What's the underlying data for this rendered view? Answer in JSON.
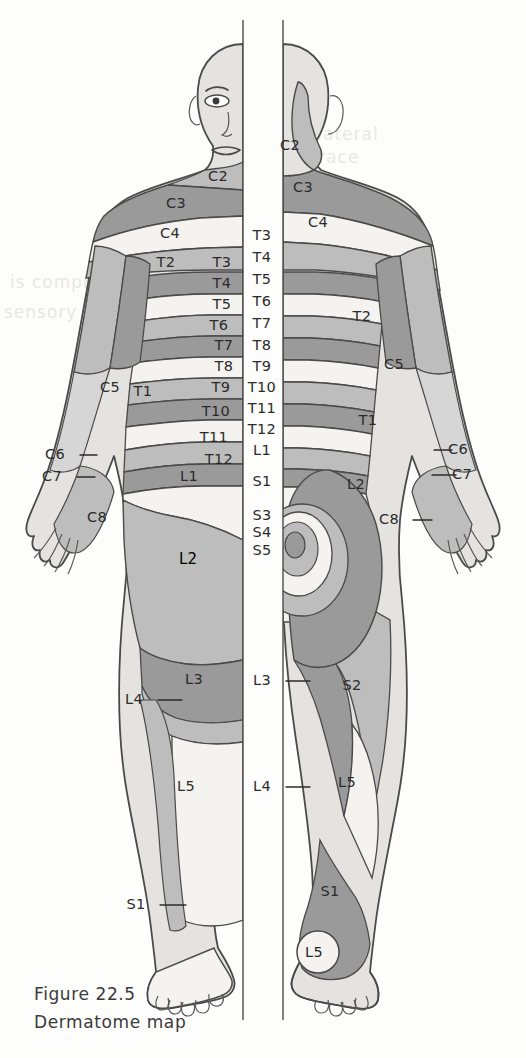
{
  "figure": {
    "caption_line1": "Figure 22.5",
    "caption_line2": "Dermatome map",
    "title": "Dermatome map",
    "view_left": "anterior",
    "view_right": "posterior"
  },
  "palette": {
    "background": "#fdfdfc",
    "tone_dark": "#9a9a9a",
    "tone_mid": "#bdbdbd",
    "tone_light": "#d6d6d6",
    "tone_white": "#f4f3f0",
    "outline": "#4a4a4a",
    "text": "#2b2b2b",
    "ghost_text": "#e9e7e4"
  },
  "ghost_text": {
    "l1": "the lateral",
    "l2": "will trace",
    "l3": "is compressed",
    "l4": "sensory nerve"
  },
  "labels": {
    "center_column": [
      {
        "text": "T3",
        "x": 262,
        "y": 240
      },
      {
        "text": "T4",
        "x": 262,
        "y": 262
      },
      {
        "text": "T5",
        "x": 262,
        "y": 284
      },
      {
        "text": "T6",
        "x": 262,
        "y": 306
      },
      {
        "text": "T7",
        "x": 262,
        "y": 328
      },
      {
        "text": "T8",
        "x": 262,
        "y": 350
      },
      {
        "text": "T9",
        "x": 262,
        "y": 371
      },
      {
        "text": "T10",
        "x": 262,
        "y": 392
      },
      {
        "text": "T11",
        "x": 262,
        "y": 413
      },
      {
        "text": "T12",
        "x": 262,
        "y": 434
      },
      {
        "text": "L1",
        "x": 262,
        "y": 455
      },
      {
        "text": "S1",
        "x": 262,
        "y": 486
      },
      {
        "text": "S3",
        "x": 262,
        "y": 520
      },
      {
        "text": "S4",
        "x": 262,
        "y": 537
      },
      {
        "text": "S5",
        "x": 262,
        "y": 555
      }
    ],
    "anterior_left": [
      {
        "text": "C2",
        "x": 218,
        "y": 181,
        "size": "lbl"
      },
      {
        "text": "C3",
        "x": 176,
        "y": 208,
        "size": "lbl"
      },
      {
        "text": "C4",
        "x": 170,
        "y": 238,
        "size": "lbl"
      },
      {
        "text": "T2",
        "x": 166,
        "y": 267,
        "size": "lbl"
      },
      {
        "text": "T3",
        "x": 222,
        "y": 267,
        "size": "lbl"
      },
      {
        "text": "T4",
        "x": 222,
        "y": 288,
        "size": "lbl"
      },
      {
        "text": "T5",
        "x": 222,
        "y": 309,
        "size": "lbl"
      },
      {
        "text": "T6",
        "x": 219,
        "y": 330,
        "size": "lbl"
      },
      {
        "text": "T7",
        "x": 224,
        "y": 350,
        "size": "lbl"
      },
      {
        "text": "T8",
        "x": 224,
        "y": 371,
        "size": "lbl"
      },
      {
        "text": "T9",
        "x": 221,
        "y": 392,
        "size": "lbl"
      },
      {
        "text": "T10",
        "x": 216,
        "y": 416,
        "size": "lbl"
      },
      {
        "text": "T11",
        "x": 214,
        "y": 442,
        "size": "lbl"
      },
      {
        "text": "T12",
        "x": 219,
        "y": 464,
        "size": "lbl"
      },
      {
        "text": "L1",
        "x": 189,
        "y": 481,
        "size": "lbl"
      },
      {
        "text": "L2",
        "x": 188,
        "y": 564,
        "size": "lbl-mid"
      },
      {
        "text": "L3",
        "x": 194,
        "y": 684,
        "size": "lbl"
      },
      {
        "text": "L5",
        "x": 186,
        "y": 791,
        "size": "lbl"
      },
      {
        "text": "C5",
        "x": 110,
        "y": 392,
        "size": "lbl"
      },
      {
        "text": "T1",
        "x": 143,
        "y": 396,
        "size": "lbl"
      },
      {
        "text": "C8",
        "x": 97,
        "y": 522,
        "size": "lbl"
      }
    ],
    "posterior_right": [
      {
        "text": "C2",
        "x": 290,
        "y": 150,
        "size": "lbl"
      },
      {
        "text": "C3",
        "x": 303,
        "y": 192,
        "size": "lbl"
      },
      {
        "text": "C4",
        "x": 318,
        "y": 227,
        "size": "lbl"
      },
      {
        "text": "T2",
        "x": 362,
        "y": 321,
        "size": "lbl"
      },
      {
        "text": "C5",
        "x": 394,
        "y": 369,
        "size": "lbl"
      },
      {
        "text": "T1",
        "x": 368,
        "y": 425,
        "size": "lbl"
      },
      {
        "text": "L2",
        "x": 356,
        "y": 489,
        "size": "lbl"
      },
      {
        "text": "S2",
        "x": 352,
        "y": 690,
        "size": "lbl"
      },
      {
        "text": "L5",
        "x": 347,
        "y": 787,
        "size": "lbl"
      },
      {
        "text": "S1",
        "x": 330,
        "y": 896,
        "size": "lbl"
      },
      {
        "text": "L5",
        "x": 314,
        "y": 957,
        "size": "lbl"
      }
    ],
    "leader_labels": [
      {
        "text": "C6",
        "tx": 55,
        "ty": 459,
        "x1": 80,
        "y1": 455,
        "x2": 97,
        "y2": 455
      },
      {
        "text": "C7",
        "tx": 52,
        "ty": 481,
        "x1": 77,
        "y1": 477,
        "x2": 95,
        "y2": 477
      },
      {
        "text": "C6",
        "tx": 458,
        "ty": 454,
        "x1": 434,
        "y1": 450,
        "x2": 452,
        "y2": 450
      },
      {
        "text": "C7",
        "tx": 462,
        "ty": 479,
        "x1": 432,
        "y1": 475,
        "x2": 456,
        "y2": 475
      },
      {
        "text": "C8",
        "tx": 389,
        "ty": 524,
        "x1": 413,
        "y1": 520,
        "x2": 432,
        "y2": 520
      },
      {
        "text": "L4",
        "tx": 134,
        "ty": 704,
        "x1": 158,
        "y1": 700,
        "x2": 182,
        "y2": 700
      },
      {
        "text": "S1",
        "tx": 136,
        "ty": 909,
        "x1": 160,
        "y1": 905,
        "x2": 186,
        "y2": 905
      },
      {
        "text": "L3",
        "tx": 262,
        "ty": 685,
        "x1": 286,
        "y1": 681,
        "x2": 310,
        "y2": 681
      },
      {
        "text": "L4",
        "tx": 262,
        "ty": 791,
        "x1": 286,
        "y1": 787,
        "x2": 310,
        "y2": 787
      }
    ]
  },
  "dermatomes": {
    "cervical": [
      "C2",
      "C3",
      "C4",
      "C5",
      "C6",
      "C7",
      "C8"
    ],
    "thoracic": [
      "T1",
      "T2",
      "T3",
      "T4",
      "T5",
      "T6",
      "T7",
      "T8",
      "T9",
      "T10",
      "T11",
      "T12"
    ],
    "lumbar": [
      "L1",
      "L2",
      "L3",
      "L4",
      "L5"
    ],
    "sacral": [
      "S1",
      "S2",
      "S3",
      "S4",
      "S5"
    ]
  }
}
